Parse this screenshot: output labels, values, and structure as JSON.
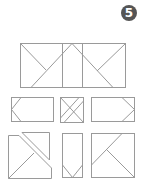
{
  "badge": {
    "number": "5",
    "color": "#555555"
  },
  "figure": {
    "line_color": "#9a9a9a",
    "assembled_shape": "rectangle divided by vertical and diagonal lines",
    "pieces_count": 6
  }
}
